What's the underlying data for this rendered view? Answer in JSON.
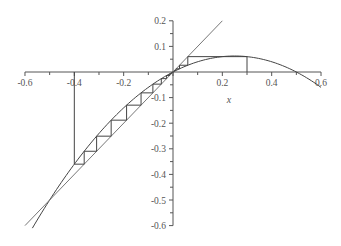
{
  "chart_data": {
    "type": "line",
    "title": "",
    "xlabel": "x",
    "ylabel": "",
    "xlim": [
      -0.6,
      0.6
    ],
    "ylim": [
      -0.6,
      0.2
    ],
    "grid": false,
    "legend": null,
    "x_ticks": [
      -0.6,
      -0.4,
      -0.2,
      0,
      0.2,
      0.4,
      0.6
    ],
    "x_tick_labels": [
      "-0.6",
      "-0.4",
      "-0.2",
      "0",
      "0.2",
      "0.4",
      "0.6"
    ],
    "y_ticks": [
      0.2,
      0.1,
      -0.1,
      -0.2,
      -0.3,
      -0.4,
      -0.5,
      -0.6
    ],
    "y_tick_labels": [
      "0.2",
      "0.1",
      "-0.1",
      "-0.2",
      "-0.3",
      "-0.4",
      "-0.5",
      "-0.6"
    ],
    "series": [
      {
        "name": "f(x) = x(0.5 - x)",
        "kind": "curve",
        "x_range": [
          -0.57,
          0.6
        ],
        "x": [
          -0.57,
          -0.5,
          -0.4,
          -0.3,
          -0.2,
          -0.1,
          0,
          0.1,
          0.2,
          0.25,
          0.3,
          0.4,
          0.5,
          0.6
        ],
        "y": [
          -0.61,
          -0.5,
          -0.36,
          -0.24,
          -0.14,
          -0.06,
          0,
          0.04,
          0.06,
          0.0625,
          0.06,
          0.04,
          0,
          -0.06
        ]
      },
      {
        "name": "y = x",
        "kind": "diagonal",
        "x": [
          -0.6,
          0.2
        ],
        "y": [
          -0.6,
          0.2
        ]
      },
      {
        "name": "cobweb from x0 = 0.3",
        "kind": "cobweb",
        "x0": 0.3,
        "iterations": 6
      },
      {
        "name": "cobweb from x0 = -0.4",
        "kind": "cobweb",
        "x0": -0.4,
        "iterations": 14
      }
    ],
    "annotations": []
  },
  "layout": {
    "origin_px": [
      173,
      72
    ],
    "x_px_per_unit": 246.7,
    "y_px_per_unit": 256,
    "axis_color": "#555555",
    "line_color": "#444444",
    "diag_color": "#777777"
  }
}
